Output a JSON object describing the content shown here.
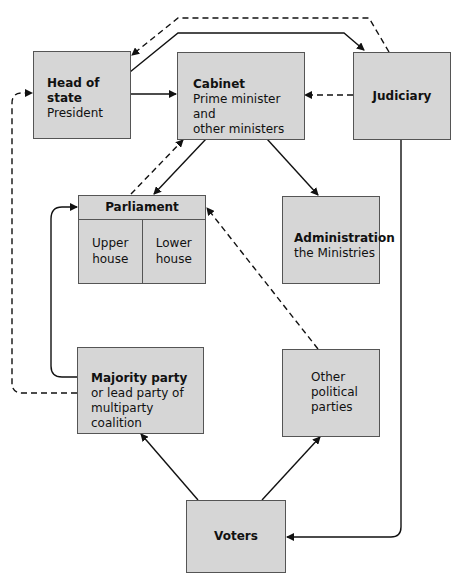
{
  "diagram": {
    "nodes": {
      "head_of_state": {
        "title": "Head of state",
        "subtitle": "President"
      },
      "cabinet": {
        "title": "Cabinet",
        "subtitle_line1": "Prime minister and",
        "subtitle_line2": "other ministers"
      },
      "judiciary": {
        "title": "Judiciary"
      },
      "parliament": {
        "title": "Parliament",
        "upper_line1": "Upper",
        "upper_line2": "house",
        "lower_line1": "Lower",
        "lower_line2": "house"
      },
      "administration": {
        "title": "Administration",
        "subtitle": "the Ministries"
      },
      "majority_party": {
        "title": "Majority party",
        "subtitle_line1": "or lead party of",
        "subtitle_line2": "multiparty coalition"
      },
      "other_parties": {
        "line1": "Other",
        "line2": "political",
        "line3": "parties"
      },
      "voters": {
        "title": "Voters"
      }
    },
    "edges": [
      {
        "from": "head_of_state",
        "to": "cabinet",
        "style": "solid"
      },
      {
        "from": "head_of_state",
        "to": "judiciary",
        "style": "solid"
      },
      {
        "from": "judiciary",
        "to": "head_of_state",
        "style": "dashed"
      },
      {
        "from": "judiciary",
        "to": "cabinet",
        "style": "dashed"
      },
      {
        "from": "cabinet",
        "to": "parliament",
        "style": "solid"
      },
      {
        "from": "parliament",
        "to": "cabinet",
        "style": "dashed"
      },
      {
        "from": "cabinet",
        "to": "administration",
        "style": "solid"
      },
      {
        "from": "majority_party",
        "to": "parliament",
        "style": "solid"
      },
      {
        "from": "majority_party",
        "to": "head_of_state",
        "style": "dashed"
      },
      {
        "from": "other_parties",
        "to": "parliament",
        "style": "dashed"
      },
      {
        "from": "voters",
        "to": "majority_party",
        "style": "solid"
      },
      {
        "from": "voters",
        "to": "other_parties",
        "style": "solid"
      },
      {
        "from": "judiciary",
        "to": "voters",
        "style": "solid"
      }
    ],
    "colors": {
      "box_fill": "#d6d6d6",
      "box_border": "#555555",
      "line": "#111111"
    }
  }
}
